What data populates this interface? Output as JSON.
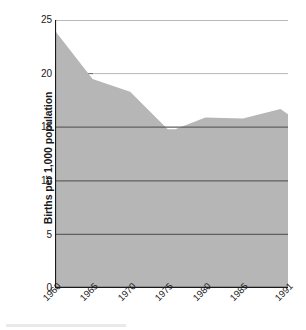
{
  "chart_data": {
    "type": "area",
    "title": "",
    "subtitle": "",
    "xlabel": "",
    "ylabel": "Births per 1,000 population",
    "x": [
      1960,
      1965,
      1970,
      1975,
      1976,
      1980,
      1985,
      1990,
      1991
    ],
    "values": [
      24.0,
      19.5,
      18.3,
      14.8,
      14.8,
      15.9,
      15.8,
      16.7,
      16.2
    ],
    "series": [
      {
        "name": "Births per 1,000 population",
        "values": [
          24.0,
          19.5,
          18.3,
          14.8,
          14.8,
          15.9,
          15.8,
          16.7,
          16.2
        ]
      }
    ],
    "xlim": [
      1960,
      1991
    ],
    "ylim": [
      0,
      25
    ],
    "x_tick_labels": [
      "1960",
      "1965",
      "1970",
      "1975",
      "1980",
      "1985",
      "1991"
    ],
    "x_tick_values": [
      1960,
      1965,
      1970,
      1975,
      1980,
      1985,
      1991
    ],
    "y_tick_labels": [
      "0",
      "5",
      "10",
      "15",
      "20",
      "25"
    ],
    "y_tick_values": [
      0,
      5,
      10,
      15,
      20,
      25
    ],
    "grid": true,
    "grid_axis": "y",
    "legend": false,
    "legend_position": "none",
    "annotations": []
  },
  "style": {
    "area_fill_color": "#b6b6b6",
    "gridline_color_over_fill": "#6e6e6e",
    "gridline_color_over_white": "#9a9a9a",
    "axis_color": "#1a1a1a",
    "text_color": "#1a1a1a",
    "background_color": "#ffffff"
  },
  "axis": {
    "y_title": "Births per 1,000 population"
  },
  "y_ticks": [
    {
      "label": "25"
    },
    {
      "label": "20"
    },
    {
      "label": "15"
    },
    {
      "label": "10"
    },
    {
      "label": "5"
    },
    {
      "label": "0"
    }
  ],
  "x_ticks": [
    {
      "label": "1960"
    },
    {
      "label": "1965"
    },
    {
      "label": "1970"
    },
    {
      "label": "1975"
    },
    {
      "label": "1980"
    },
    {
      "label": "1985"
    },
    {
      "label": "1991"
    }
  ]
}
